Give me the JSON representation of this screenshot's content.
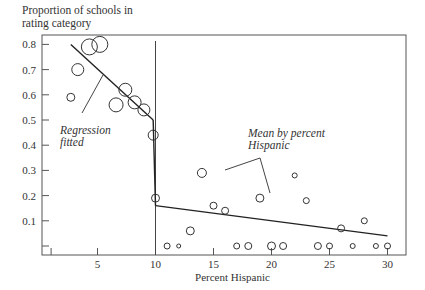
{
  "chart_data": {
    "type": "scatter",
    "title": "",
    "ylabel_lines": [
      "Proportion of schools in",
      "rating category"
    ],
    "xlabel": "Percent Hispanic",
    "xlim": [
      0,
      30.5
    ],
    "ylim": [
      -0.03,
      0.84
    ],
    "x_ticks": [
      1,
      5,
      10,
      15,
      20,
      25,
      30
    ],
    "x_tick_labels": [
      "",
      "5",
      "10",
      "15",
      "20",
      "25",
      "30"
    ],
    "y_ticks": [
      0.0,
      0.1,
      0.2,
      0.3,
      0.4,
      0.5,
      0.6,
      0.7,
      0.8
    ],
    "y_tick_labels": [
      "",
      "0.1",
      "0.2",
      "0.3",
      "0.4",
      "0.5",
      "0.6",
      "0.7",
      "0.8"
    ],
    "cutoff_x": 10,
    "series": [
      {
        "name": "Mean by percent Hispanic",
        "marker": "open-circle",
        "points": [
          {
            "x": 2.7,
            "y": 0.59,
            "r": 4
          },
          {
            "x": 3.3,
            "y": 0.7,
            "r": 6
          },
          {
            "x": 4.3,
            "y": 0.79,
            "r": 8
          },
          {
            "x": 5.2,
            "y": 0.8,
            "r": 8
          },
          {
            "x": 6.6,
            "y": 0.56,
            "r": 7
          },
          {
            "x": 7.4,
            "y": 0.62,
            "r": 6.5
          },
          {
            "x": 8.2,
            "y": 0.57,
            "r": 6.5
          },
          {
            "x": 9.0,
            "y": 0.54,
            "r": 6
          },
          {
            "x": 9.8,
            "y": 0.44,
            "r": 5
          },
          {
            "x": 10.0,
            "y": 0.19,
            "r": 4
          },
          {
            "x": 11.0,
            "y": 0.0,
            "r": 3
          },
          {
            "x": 12.0,
            "y": 0.0,
            "r": 2
          },
          {
            "x": 13.0,
            "y": 0.06,
            "r": 4
          },
          {
            "x": 14.0,
            "y": 0.29,
            "r": 4.5
          },
          {
            "x": 15.0,
            "y": 0.16,
            "r": 3.5
          },
          {
            "x": 16.0,
            "y": 0.14,
            "r": 3.5
          },
          {
            "x": 17.0,
            "y": 0.0,
            "r": 3
          },
          {
            "x": 18.0,
            "y": 0.0,
            "r": 3.5
          },
          {
            "x": 19.0,
            "y": 0.19,
            "r": 4
          },
          {
            "x": 20.0,
            "y": 0.0,
            "r": 4
          },
          {
            "x": 21.0,
            "y": 0.0,
            "r": 3.5
          },
          {
            "x": 22.0,
            "y": 0.28,
            "r": 2.5
          },
          {
            "x": 23.0,
            "y": 0.18,
            "r": 3
          },
          {
            "x": 24.0,
            "y": 0.0,
            "r": 3.5
          },
          {
            "x": 25.0,
            "y": 0.0,
            "r": 3
          },
          {
            "x": 26.0,
            "y": 0.07,
            "r": 3.5
          },
          {
            "x": 27.0,
            "y": 0.0,
            "r": 2.5
          },
          {
            "x": 28.0,
            "y": 0.1,
            "r": 3
          },
          {
            "x": 29.0,
            "y": 0.0,
            "r": 2.5
          },
          {
            "x": 30.0,
            "y": 0.0,
            "r": 3
          }
        ]
      },
      {
        "name": "Regression fitted",
        "type": "line",
        "segments": [
          [
            {
              "x": 2.7,
              "y": 0.8
            },
            {
              "x": 9.8,
              "y": 0.5
            }
          ],
          [
            {
              "x": 9.8,
              "y": 0.5
            },
            {
              "x": 10.0,
              "y": 0.16
            }
          ],
          [
            {
              "x": 10.0,
              "y": 0.16
            },
            {
              "x": 30.0,
              "y": 0.04
            }
          ]
        ]
      }
    ],
    "annotations": [
      {
        "text_lines": [
          "Regression",
          "fitted"
        ],
        "italic": true
      },
      {
        "text_lines": [
          "Mean by percent",
          "Hispanic"
        ],
        "italic": true
      }
    ]
  }
}
